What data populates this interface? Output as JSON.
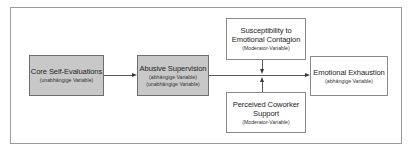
{
  "diagram": {
    "type": "moderated-mediation-model",
    "nodes": [
      {
        "id": "core_self_evaluations",
        "title": "Core Self-Evaluations",
        "subtitles": [
          "(unabhängige Variable)"
        ],
        "style": "shaded",
        "fill": "#c8c8c8"
      },
      {
        "id": "abusive_supervision",
        "title": "Abusive Supervision",
        "subtitles": [
          "(abhängige Variable)",
          "(unabhängige Variable)"
        ],
        "style": "shaded",
        "fill": "#c8c8c8"
      },
      {
        "id": "susceptibility",
        "title_lines": [
          "Susceptibility to",
          "Emotional Contagion"
        ],
        "subtitles": [
          "(Moderator-Variable)"
        ],
        "style": "plain",
        "fill": "#ffffff"
      },
      {
        "id": "coworker_support",
        "title_lines": [
          "Perceived Coworker",
          "Support"
        ],
        "subtitles": [
          "(Moderator-Variable)"
        ],
        "style": "plain",
        "fill": "#ffffff"
      },
      {
        "id": "emotional_exhaustion",
        "title": "Emotional Exhaustion",
        "subtitles": [
          "(abhängige Variable)"
        ],
        "style": "plain",
        "fill": "#ffffff"
      }
    ],
    "edges": [
      {
        "from": "core_self_evaluations",
        "to": "abusive_supervision",
        "kind": "arrow"
      },
      {
        "from": "abusive_supervision",
        "to": "emotional_exhaustion",
        "kind": "arrow"
      },
      {
        "from": "susceptibility",
        "to": "abusive_supervision->emotional_exhaustion",
        "kind": "moderation-arrow"
      },
      {
        "from": "coworker_support",
        "to": "abusive_supervision->emotional_exhaustion",
        "kind": "moderation-arrow"
      }
    ]
  }
}
